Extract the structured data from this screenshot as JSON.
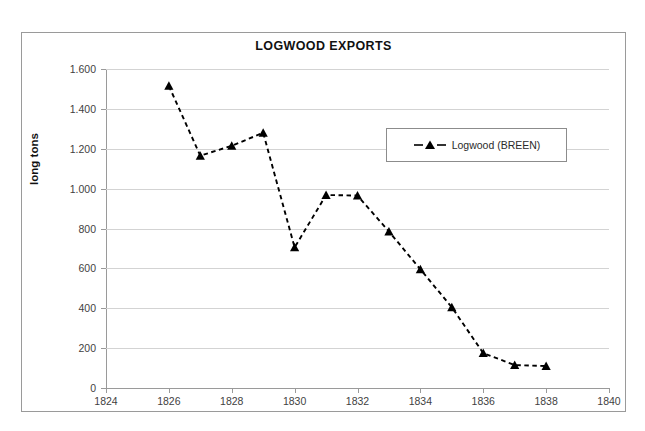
{
  "chart_data": {
    "type": "line",
    "title": "LOGWOOD EXPORTS",
    "xlabel": "",
    "ylabel": "long tons",
    "xlim": [
      1824,
      1840
    ],
    "ylim": [
      0,
      1600
    ],
    "xticks": [
      "1824",
      "1826",
      "1828",
      "1830",
      "1832",
      "1834",
      "1836",
      "1838",
      "1840"
    ],
    "xtick_values": [
      1824,
      1826,
      1828,
      1830,
      1832,
      1834,
      1836,
      1838,
      1840
    ],
    "yticks": [
      "0",
      "200",
      "400",
      "600",
      "800",
      "1.000",
      "1.200",
      "1.400",
      "1.600"
    ],
    "ytick_values": [
      0,
      200,
      400,
      600,
      800,
      1000,
      1200,
      1400,
      1600
    ],
    "grid": "horizontal",
    "legend_position": "inside-upper-right",
    "x": [
      1826,
      1827,
      1828,
      1829,
      1830,
      1831,
      1832,
      1833,
      1834,
      1835,
      1836,
      1837,
      1838
    ],
    "series": [
      {
        "name": "Logwood (BREEN)",
        "marker": "triangle",
        "linestyle": "dashed",
        "color": "#000000",
        "values": [
          1515,
          1165,
          1215,
          1280,
          705,
          968,
          965,
          785,
          595,
          405,
          175,
          115,
          110
        ]
      }
    ]
  },
  "legend": {
    "entries": [
      {
        "label": "Logwood (BREEN)"
      }
    ]
  },
  "colors": {
    "series": "#000000",
    "gridline": "#d3d3d3",
    "axis": "#9a9a9a",
    "frame_border": "#9a9a9a",
    "text": "#3f3f3f",
    "title_text": "#111111",
    "background": "#ffffff"
  }
}
